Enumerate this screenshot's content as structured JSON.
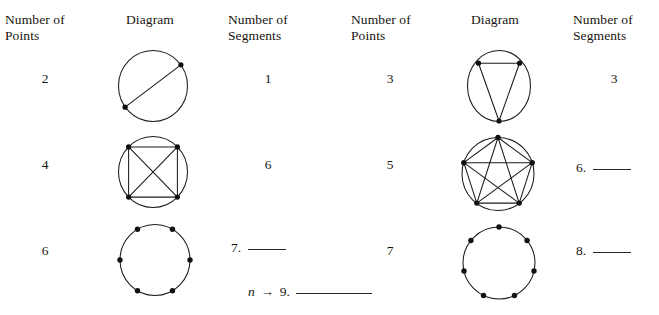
{
  "worksheet": {
    "tables": [
      {
        "id": "left-table",
        "headers": {
          "points": "Number of\nPoints",
          "diagram": "Diagram",
          "segments": "Number of\nSegments"
        },
        "rows": [
          {
            "points": "2",
            "segments": "1",
            "diagram": {
              "name": "circle-2-points-1-segment",
              "point_count": 2,
              "segment_count": 1,
              "points_angles_deg": [
                37,
                205
              ],
              "radius": 35,
              "segments_pairs": [
                [
                  0,
                  1
                ]
              ]
            }
          },
          {
            "points": "4",
            "segments": "6",
            "diagram": {
              "name": "circle-4-points-6-segments",
              "point_count": 4,
              "segment_count": 6,
              "points_angles_deg": [
                45,
                135,
                225,
                315
              ],
              "radius": 35,
              "segments_pairs": [
                [
                  0,
                  1
                ],
                [
                  0,
                  2
                ],
                [
                  0,
                  3
                ],
                [
                  1,
                  2
                ],
                [
                  1,
                  3
                ],
                [
                  2,
                  3
                ]
              ]
            }
          },
          {
            "points": "6",
            "segments": null,
            "diagram": {
              "name": "circle-6-points-no-segments",
              "point_count": 6,
              "segment_count": 0,
              "points_angles_deg": [
                60,
                120,
                180,
                240,
                300,
                0
              ],
              "radius": 35,
              "segments_pairs": []
            }
          }
        ],
        "blanks": [
          {
            "number": "7.",
            "rule": "short",
            "answer": ""
          }
        ]
      },
      {
        "id": "right-table",
        "headers": {
          "points": "Number of\nPoints",
          "diagram": "Diagram",
          "segments": "Number of\nSegments"
        },
        "rows": [
          {
            "points": "3",
            "segments": "3",
            "diagram": {
              "name": "circle-3-points-3-segments",
              "point_count": 3,
              "segment_count": 3,
              "points_angles_deg": [
                50,
                130,
                270
              ],
              "radius": 35,
              "segments_pairs": [
                [
                  0,
                  1
                ],
                [
                  0,
                  2
                ],
                [
                  1,
                  2
                ]
              ]
            }
          },
          {
            "points": "5",
            "segments": null,
            "diagram": {
              "name": "circle-5-points-10-segments",
              "point_count": 5,
              "segment_count": 10,
              "points_angles_deg": [
                90,
                162,
                234,
                306,
                18
              ],
              "radius": 37,
              "segments_pairs": [
                [
                  0,
                  1
                ],
                [
                  0,
                  2
                ],
                [
                  0,
                  3
                ],
                [
                  0,
                  4
                ],
                [
                  1,
                  2
                ],
                [
                  1,
                  3
                ],
                [
                  1,
                  4
                ],
                [
                  2,
                  3
                ],
                [
                  2,
                  4
                ],
                [
                  3,
                  4
                ]
              ]
            }
          },
          {
            "points": "7",
            "segments": null,
            "diagram": {
              "name": "circle-7-points-no-segments",
              "point_count": 7,
              "segment_count": 0,
              "points_angles_deg": [
                90,
                141.4,
                192.9,
                244.3,
                295.7,
                347.1,
                38.6
              ],
              "radius": 37,
              "segments_pairs": []
            }
          }
        ],
        "blanks": [
          {
            "number": "6.",
            "rule": "short",
            "answer": ""
          },
          {
            "number": "8.",
            "rule": "short",
            "answer": ""
          }
        ]
      }
    ],
    "general_case": {
      "variable": "n",
      "arrow": "→",
      "number": "9.",
      "rule": "long",
      "answer": ""
    },
    "colors": {
      "ink": "#17140f",
      "stroke": "#1d1a16",
      "background": "#ffffff"
    }
  }
}
